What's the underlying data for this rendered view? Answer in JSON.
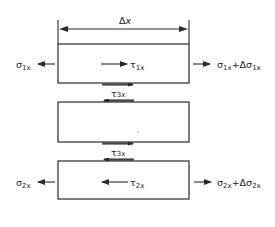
{
  "diagram": {
    "dimension": {
      "label_symbol": "Δ",
      "label_var": "x"
    },
    "layers": [
      {
        "id": "layer-1",
        "left_stress": {
          "sym": "σ",
          "sub": "1x"
        },
        "right_stress": {
          "sym": "σ",
          "sub": "1x",
          "plus": "+Δσ",
          "sub2": "1x"
        },
        "shear": {
          "sym": "τ",
          "sub": "1x",
          "direction": "right"
        }
      },
      {
        "id": "layer-3",
        "interface_shear": {
          "sym": "τ",
          "sub": "3x"
        }
      },
      {
        "id": "layer-2",
        "left_stress": {
          "sym": "σ",
          "sub": "2x"
        },
        "right_stress": {
          "sym": "σ",
          "sub": "2x",
          "plus": "+Δσ",
          "sub2": "2x"
        },
        "shear": {
          "sym": "τ",
          "sub": "2x",
          "direction": "left"
        }
      }
    ],
    "interfaces": [
      {
        "between": "layer-1/layer-3",
        "sym": "τ",
        "sub": "3x"
      },
      {
        "between": "layer-3/layer-2",
        "sym": "τ",
        "sub": "3x"
      }
    ],
    "colors": {
      "ink": "#2a2a2a",
      "background": "#ffffff"
    }
  }
}
